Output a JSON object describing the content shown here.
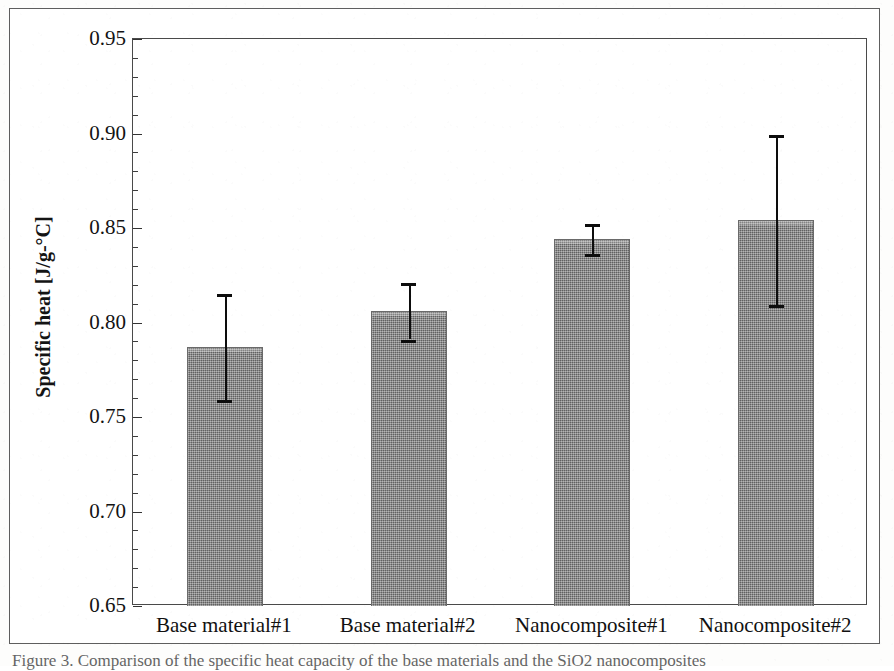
{
  "figure": {
    "caption": "Figure 3. Comparison of the specific heat capacity of the base materials and the SiO2 nanocomposites",
    "background_color": "#ffffff",
    "frame_color": "#5e5e5e"
  },
  "axes": {
    "y_label": "Specific heat [J/g-°C]",
    "y_ticks": [
      "0.95",
      "0.90",
      "0.85",
      "0.80",
      "0.75",
      "0.70",
      "0.65"
    ],
    "y_min": 0.65,
    "y_max": 0.95,
    "y_major_step": 0.05,
    "y_minor_step": 0.01,
    "x_label": ""
  },
  "chart_data": {
    "type": "bar",
    "title": "",
    "xlabel": "",
    "ylabel": "Specific heat [J/g-°C]",
    "ylim": [
      0.65,
      0.95
    ],
    "grid": false,
    "legend": "none",
    "bar_color": "#7b7b7b",
    "error_color": "#0d0d0d",
    "categories": [
      "Base material#1",
      "Base material#2",
      "Nanocomposite#1",
      "Nanocomposite#2"
    ],
    "values": [
      0.787,
      0.806,
      0.844,
      0.854
    ],
    "errors": [
      0.028,
      0.015,
      0.008,
      0.045
    ],
    "error_upper": [
      0.815,
      0.821,
      0.852,
      0.899
    ],
    "error_lower": [
      0.759,
      0.791,
      0.836,
      0.809
    ]
  }
}
